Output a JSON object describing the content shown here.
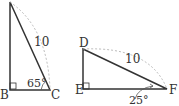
{
  "figure": {
    "triangle_left": {
      "vertices": {
        "top": "",
        "B": "B",
        "C": "C"
      },
      "hypotenuse_label": "10",
      "angle_label": "65°",
      "right_angle_at": "B"
    },
    "triangle_right": {
      "vertices": {
        "D": "D",
        "E": "E",
        "F": "F"
      },
      "hypotenuse_label": "10",
      "angle_label": "25°",
      "right_angle_at": "E"
    },
    "colors": {
      "line": "#333333",
      "arc": "#999999"
    }
  }
}
